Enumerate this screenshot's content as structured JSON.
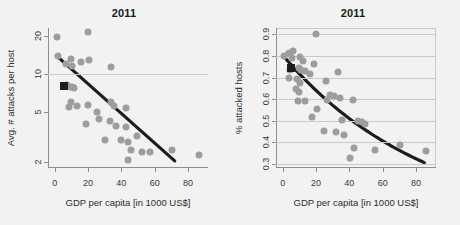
{
  "figure": {
    "background": "#f2f2f2",
    "point_color": "#9d9d9d",
    "line_color": "#1c1c1c",
    "marker_color": "#1e1e1e",
    "grid_color": "#c9c9cc"
  },
  "chart_data": [
    {
      "type": "scatter",
      "panel": "left",
      "title": "2011",
      "xlabel": "GDP per capita [in 1000 US$]",
      "ylabel": "Avg. # attacks per host",
      "xlim": [
        -4,
        92
      ],
      "ylim": [
        1.8,
        23
      ],
      "yscale": "log",
      "xscale": "linear",
      "xticks": [
        0,
        20,
        40,
        60,
        80
      ],
      "xticklabels": [
        "0",
        "20",
        "40",
        "60",
        "80"
      ],
      "yticks": [
        2,
        5,
        10,
        20
      ],
      "yticklabels": [
        "2",
        "5",
        "10",
        "20"
      ],
      "gridlines_y": [
        10
      ],
      "grid": "single-horizontal",
      "frame": false,
      "legend": "none",
      "points": [
        {
          "x": 1.5,
          "y": 19.5
        },
        {
          "x": 20.0,
          "y": 21.5
        },
        {
          "x": 2.0,
          "y": 13.8
        },
        {
          "x": 6.5,
          "y": 12.0
        },
        {
          "x": 9.5,
          "y": 13.2
        },
        {
          "x": 10.5,
          "y": 11.6
        },
        {
          "x": 16.0,
          "y": 12.4
        },
        {
          "x": 20.5,
          "y": 12.9
        },
        {
          "x": 34.0,
          "y": 11.3
        },
        {
          "x": 7.5,
          "y": 8.1
        },
        {
          "x": 9.0,
          "y": 7.9
        },
        {
          "x": 10.5,
          "y": 7.8
        },
        {
          "x": 11.5,
          "y": 7.7
        },
        {
          "x": 10.0,
          "y": 6.0
        },
        {
          "x": 8.5,
          "y": 5.5
        },
        {
          "x": 13.5,
          "y": 5.6
        },
        {
          "x": 20.0,
          "y": 5.7
        },
        {
          "x": 25.5,
          "y": 5.0
        },
        {
          "x": 33.5,
          "y": 6.0
        },
        {
          "x": 35.5,
          "y": 5.6
        },
        {
          "x": 43.0,
          "y": 5.4
        },
        {
          "x": 19.0,
          "y": 4.0
        },
        {
          "x": 26.5,
          "y": 4.4
        },
        {
          "x": 33.0,
          "y": 4.2
        },
        {
          "x": 37.0,
          "y": 3.9
        },
        {
          "x": 43.0,
          "y": 3.8
        },
        {
          "x": 30.0,
          "y": 3.0
        },
        {
          "x": 40.0,
          "y": 3.0
        },
        {
          "x": 44.0,
          "y": 2.9
        },
        {
          "x": 49.5,
          "y": 3.2
        },
        {
          "x": 45.5,
          "y": 2.5
        },
        {
          "x": 52.5,
          "y": 2.4
        },
        {
          "x": 57.0,
          "y": 2.4
        },
        {
          "x": 70.5,
          "y": 2.5
        },
        {
          "x": 86.5,
          "y": 2.3
        },
        {
          "x": 44.0,
          "y": 2.1
        }
      ],
      "highlight_marker": {
        "x": 5.5,
        "y": 8.0,
        "shape": "square"
      },
      "trend": {
        "kind": "linear-on-log",
        "x_start": 1.0,
        "y_start": 13.9,
        "x_end": 72.0,
        "y_end": 2.05
      }
    },
    {
      "type": "scatter",
      "panel": "right",
      "title": "2011",
      "xlabel": "GDP per capita [in 1000 US$]",
      "ylabel": "% attacked hosts",
      "xlim": [
        -4,
        92
      ],
      "ylim": [
        0.28,
        0.93
      ],
      "yscale": "linear",
      "xscale": "linear",
      "xticks": [
        0,
        20,
        40,
        60,
        80
      ],
      "xticklabels": [
        "0",
        "20",
        "40",
        "60",
        "80"
      ],
      "yticks": [
        0.3,
        0.4,
        0.5,
        0.6,
        0.7,
        0.8,
        0.9
      ],
      "yticklabels": [
        "0.3",
        "0.4",
        "0.5",
        "0.6",
        "0.7",
        "0.8",
        "0.9"
      ],
      "gridlines_y": [
        0.3,
        0.4,
        0.5,
        0.6,
        0.7,
        0.8,
        0.9
      ],
      "grid": "horizontal",
      "frame": true,
      "legend": "none",
      "points": [
        {
          "x": 20.0,
          "y": 0.9
        },
        {
          "x": 1.0,
          "y": 0.8
        },
        {
          "x": 3.5,
          "y": 0.815
        },
        {
          "x": 6.0,
          "y": 0.825
        },
        {
          "x": 5.5,
          "y": 0.79
        },
        {
          "x": 10.5,
          "y": 0.795
        },
        {
          "x": 12.0,
          "y": 0.775
        },
        {
          "x": 19.0,
          "y": 0.765
        },
        {
          "x": 4.5,
          "y": 0.735
        },
        {
          "x": 9.5,
          "y": 0.745
        },
        {
          "x": 11.0,
          "y": 0.735
        },
        {
          "x": 13.5,
          "y": 0.73
        },
        {
          "x": 16.5,
          "y": 0.715
        },
        {
          "x": 33.0,
          "y": 0.725
        },
        {
          "x": 4.0,
          "y": 0.7
        },
        {
          "x": 8.5,
          "y": 0.695
        },
        {
          "x": 10.5,
          "y": 0.675
        },
        {
          "x": 26.0,
          "y": 0.685
        },
        {
          "x": 8.0,
          "y": 0.645
        },
        {
          "x": 9.5,
          "y": 0.635
        },
        {
          "x": 28.5,
          "y": 0.62
        },
        {
          "x": 31.0,
          "y": 0.615
        },
        {
          "x": 34.5,
          "y": 0.605
        },
        {
          "x": 9.0,
          "y": 0.59
        },
        {
          "x": 13.5,
          "y": 0.59
        },
        {
          "x": 26.5,
          "y": 0.595
        },
        {
          "x": 42.0,
          "y": 0.595
        },
        {
          "x": 20.5,
          "y": 0.555
        },
        {
          "x": 35.5,
          "y": 0.505
        },
        {
          "x": 17.5,
          "y": 0.515
        },
        {
          "x": 45.0,
          "y": 0.5
        },
        {
          "x": 47.5,
          "y": 0.495
        },
        {
          "x": 49.5,
          "y": 0.485
        },
        {
          "x": 24.5,
          "y": 0.45
        },
        {
          "x": 32.0,
          "y": 0.445
        },
        {
          "x": 36.5,
          "y": 0.435
        },
        {
          "x": 43.0,
          "y": 0.375
        },
        {
          "x": 55.5,
          "y": 0.365
        },
        {
          "x": 70.5,
          "y": 0.385
        },
        {
          "x": 86.0,
          "y": 0.36
        },
        {
          "x": 40.5,
          "y": 0.325
        }
      ],
      "highlight_marker": {
        "x": 5.0,
        "y": 0.745,
        "shape": "square"
      },
      "trend": {
        "kind": "exponential-decay",
        "x_start": 0.5,
        "y_start": 0.8,
        "x_end": 85.0,
        "y_end": 0.305
      }
    }
  ]
}
